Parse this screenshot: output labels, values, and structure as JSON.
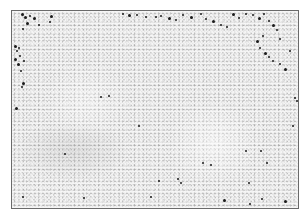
{
  "image": {
    "description": "Grayscale histology micrograph of lymphoid tissue with scattered dark-stained cells",
    "frame": {
      "x": 11,
      "y": 10,
      "width": 287,
      "height": 198
    },
    "colors": {
      "background": "#ffffff",
      "tissue": "#e6e6e6",
      "border": "#6a6a6a",
      "stained_cells": "#1a1a1a"
    },
    "regions": [
      {
        "name": "pale-follicle-center",
        "x": 165,
        "y": 100,
        "w": 95,
        "h": 85,
        "color": "rgba(255,255,255,0.45)"
      },
      {
        "name": "pale-follicle-left",
        "x": 40,
        "y": 60,
        "w": 90,
        "h": 80,
        "color": "rgba(255,255,255,0.3)"
      },
      {
        "name": "darker-band-lower-left",
        "x": 10,
        "y": 120,
        "w": 120,
        "h": 60,
        "color": "rgba(150,150,150,0.18)"
      }
    ],
    "cells": [
      [
        21,
        13,
        3
      ],
      [
        24,
        16,
        3
      ],
      [
        29,
        15,
        2
      ],
      [
        33,
        17,
        3
      ],
      [
        26,
        22,
        3
      ],
      [
        38,
        24,
        2
      ],
      [
        50,
        15,
        3
      ],
      [
        49,
        21,
        2
      ],
      [
        22,
        28,
        2
      ],
      [
        14,
        45,
        3
      ],
      [
        16,
        50,
        2
      ],
      [
        18,
        47,
        2
      ],
      [
        14,
        58,
        3
      ],
      [
        19,
        55,
        2
      ],
      [
        23,
        60,
        2
      ],
      [
        17,
        63,
        3
      ],
      [
        20,
        70,
        2
      ],
      [
        22,
        82,
        3
      ],
      [
        21,
        86,
        2
      ],
      [
        100,
        96,
        2
      ],
      [
        108,
        95,
        2
      ],
      [
        15,
        107,
        3
      ],
      [
        64,
        153,
        2
      ],
      [
        138,
        125,
        2
      ],
      [
        83,
        197,
        2
      ],
      [
        22,
        196,
        2
      ],
      [
        122,
        13,
        2
      ],
      [
        128,
        14,
        3
      ],
      [
        136,
        14,
        2
      ],
      [
        145,
        16,
        2
      ],
      [
        155,
        16,
        2
      ],
      [
        160,
        15,
        2
      ],
      [
        168,
        17,
        3
      ],
      [
        175,
        19,
        2
      ],
      [
        182,
        14,
        2
      ],
      [
        190,
        16,
        3
      ],
      [
        200,
        13,
        2
      ],
      [
        205,
        18,
        2
      ],
      [
        212,
        20,
        3
      ],
      [
        220,
        24,
        2
      ],
      [
        226,
        26,
        2
      ],
      [
        232,
        13,
        3
      ],
      [
        238,
        17,
        2
      ],
      [
        245,
        13,
        2
      ],
      [
        252,
        14,
        2
      ],
      [
        258,
        17,
        3
      ],
      [
        263,
        13,
        2
      ],
      [
        268,
        20,
        2
      ],
      [
        272,
        24,
        3
      ],
      [
        276,
        29,
        2
      ],
      [
        262,
        35,
        2
      ],
      [
        256,
        40,
        3
      ],
      [
        259,
        47,
        2
      ],
      [
        264,
        52,
        3
      ],
      [
        268,
        56,
        2
      ],
      [
        272,
        60,
        2
      ],
      [
        279,
        63,
        2
      ],
      [
        284,
        68,
        3
      ],
      [
        279,
        38,
        2
      ],
      [
        289,
        50,
        2
      ],
      [
        294,
        97,
        2
      ],
      [
        296,
        100,
        2
      ],
      [
        158,
        180,
        2
      ],
      [
        177,
        178,
        2
      ],
      [
        180,
        182,
        2
      ],
      [
        202,
        162,
        2
      ],
      [
        210,
        164,
        2
      ],
      [
        245,
        150,
        2
      ],
      [
        248,
        182,
        2
      ],
      [
        223,
        199,
        3
      ],
      [
        249,
        203,
        2
      ],
      [
        261,
        198,
        2
      ],
      [
        266,
        162,
        2
      ],
      [
        284,
        200,
        3
      ],
      [
        292,
        125,
        2
      ],
      [
        260,
        150,
        2
      ],
      [
        150,
        196,
        2
      ]
    ]
  }
}
